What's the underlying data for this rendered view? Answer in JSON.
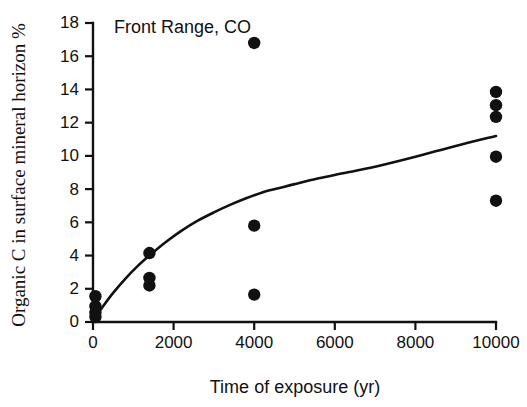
{
  "figure": {
    "panel_label": "Front Range, CO",
    "background_color": "#ffffff",
    "ink_color": "#111111"
  },
  "chart_data": {
    "type": "scatter",
    "title": "Front Range, CO",
    "xlabel": "Time of exposure (yr)",
    "ylabel": "Organic C in surface mineral horizon %",
    "xlim": [
      0,
      10000
    ],
    "ylim": [
      0,
      18
    ],
    "xticks": [
      0,
      2000,
      4000,
      6000,
      8000,
      10000
    ],
    "xtick_labels": [
      "0",
      "2000",
      "4000",
      "6000",
      "8000",
      "10000"
    ],
    "yticks": [
      0,
      2,
      4,
      6,
      8,
      10,
      12,
      14,
      16,
      18
    ],
    "ytick_labels": [
      "0",
      "2",
      "4",
      "6",
      "8",
      "10",
      "12",
      "14",
      "16",
      "18"
    ],
    "grid": false,
    "legend": false,
    "marker": "filled-circle",
    "marker_color": "#111111",
    "points": [
      {
        "x": 60,
        "y": 1.55
      },
      {
        "x": 60,
        "y": 0.95
      },
      {
        "x": 60,
        "y": 0.55
      },
      {
        "x": 60,
        "y": 0.3
      },
      {
        "x": 1400,
        "y": 4.15
      },
      {
        "x": 1400,
        "y": 2.65
      },
      {
        "x": 1400,
        "y": 2.2
      },
      {
        "x": 4000,
        "y": 16.8
      },
      {
        "x": 4000,
        "y": 5.8
      },
      {
        "x": 4000,
        "y": 1.65
      },
      {
        "x": 10000,
        "y": 13.85
      },
      {
        "x": 10000,
        "y": 13.05
      },
      {
        "x": 10000,
        "y": 12.35
      },
      {
        "x": 10000,
        "y": 9.95
      },
      {
        "x": 10000,
        "y": 7.3
      }
    ],
    "fit_curve": {
      "name": "fitted accumulation curve",
      "x": [
        0,
        250,
        500,
        800,
        1100,
        1400,
        1800,
        2200,
        2600,
        3000,
        3400,
        3800,
        4200,
        4600,
        5000,
        5600,
        6200,
        7000,
        8000,
        9000,
        10000
      ],
      "y": [
        0.1,
        0.95,
        1.75,
        2.6,
        3.35,
        4.0,
        4.8,
        5.5,
        6.1,
        6.6,
        7.05,
        7.45,
        7.8,
        8.05,
        8.3,
        8.65,
        8.95,
        9.35,
        9.95,
        10.6,
        11.2
      ]
    }
  }
}
